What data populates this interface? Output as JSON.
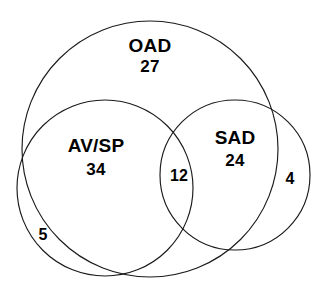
{
  "figure": {
    "type": "venn-diagram",
    "background_color": "#ffffff",
    "stroke_color": "#1a1a1a",
    "text_color": "#000000"
  },
  "sets": [
    {
      "key": "oad",
      "name": "OAD",
      "count": "27",
      "cx": 150,
      "cy": 149,
      "r": 128
    },
    {
      "key": "avsp",
      "name": "AV/SP",
      "count": "34",
      "cx": 105,
      "cy": 188,
      "r": 88
    },
    {
      "key": "sad",
      "name": "SAD",
      "count": "24",
      "cx": 235,
      "cy": 175,
      "r": 75
    }
  ],
  "regions": [
    {
      "key": "avsp_sad_overlap",
      "count": "12",
      "x": 179,
      "y": 177
    },
    {
      "key": "sad_outside_oad",
      "count": "4",
      "x": 290,
      "y": 180
    },
    {
      "key": "avsp_outside_oad",
      "count": "5",
      "x": 43,
      "y": 236
    }
  ],
  "chart_data": {
    "type": "venn",
    "title": "",
    "sets": [
      "OAD",
      "AV/SP",
      "SAD"
    ],
    "labels": {
      "OAD": 27,
      "AV/SP": 34,
      "SAD": 24,
      "AV/SP∩SAD": 12,
      "SAD outside OAD": 4,
      "AV/SP outside OAD": 5
    },
    "values": [
      27,
      34,
      24,
      12,
      4,
      5
    ],
    "legend": "none",
    "grid": false
  }
}
